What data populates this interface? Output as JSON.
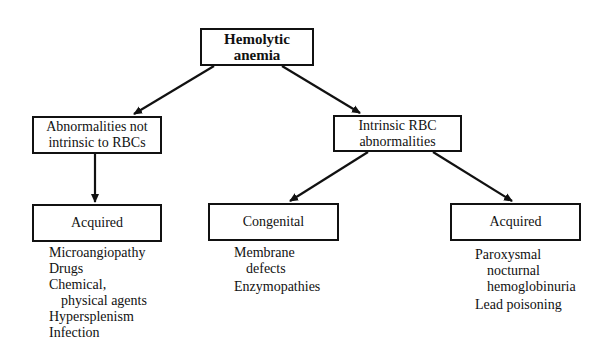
{
  "diagram": {
    "root": {
      "label": "Hemolytic anemia"
    },
    "branches": [
      {
        "label_lines": [
          "Abnormalities not",
          "intrinsic to RBCs"
        ],
        "children": [
          {
            "label": "Acquired",
            "items": [
              {
                "lines": [
                  "Microangiopathy"
                ]
              },
              {
                "lines": [
                  "Drugs"
                ]
              },
              {
                "lines": [
                  "Chemical,",
                  "physical agents"
                ]
              },
              {
                "lines": [
                  "Hypersplenism"
                ]
              },
              {
                "lines": [
                  "Infection"
                ]
              }
            ]
          }
        ]
      },
      {
        "label_lines": [
          "Intrinsic RBC",
          "abnormalities"
        ],
        "children": [
          {
            "label": "Congenital",
            "items": [
              {
                "lines": [
                  "Membrane",
                  "defects"
                ]
              },
              {
                "lines": [
                  "Enzymopathies"
                ]
              }
            ]
          },
          {
            "label": "Acquired",
            "items": [
              {
                "lines": [
                  "Paroxysmal",
                  "nocturnal",
                  "hemoglobinuria"
                ]
              },
              {
                "lines": [
                  "Lead poisoning"
                ]
              }
            ]
          }
        ]
      }
    ],
    "colors": {
      "stroke": "#111111",
      "background": "#ffffff"
    }
  }
}
